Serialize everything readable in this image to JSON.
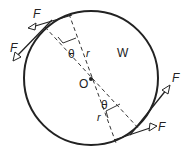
{
  "diagram": {
    "labels": {
      "force_top_1": "F",
      "force_top_2": "F",
      "force_bottom_1": "F",
      "force_bottom_2": "F",
      "weight": "W",
      "center": "O",
      "angle_top": "θ",
      "angle_bottom": "θ",
      "radius_top": "r",
      "radius_bottom": "r"
    },
    "colors": {
      "stroke": "#222222",
      "background": "#ffffff"
    }
  }
}
